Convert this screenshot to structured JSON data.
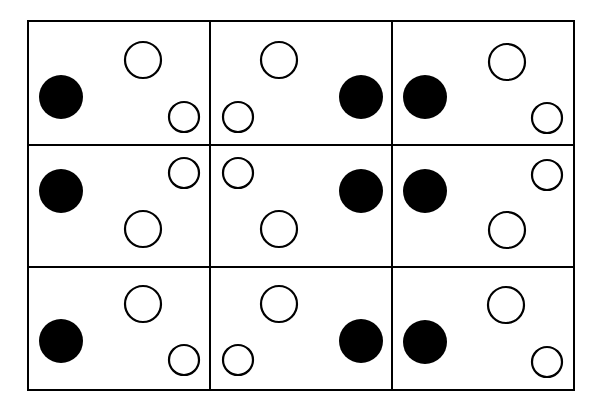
{
  "diagram": {
    "colors": {
      "stroke": "#000000",
      "filled": "#000000",
      "background": "#ffffff"
    },
    "grid": {
      "left": 28,
      "top": 21,
      "right": 574,
      "bottom": 390,
      "cols": [
        28,
        210,
        392,
        574
      ],
      "rows": [
        21,
        145,
        267,
        390
      ]
    },
    "cells": [
      {
        "row": 1,
        "col": 1,
        "circles": [
          {
            "cx": 61,
            "cy": 97,
            "r": 22,
            "filled": true
          },
          {
            "cx": 143,
            "cy": 60,
            "r": 18,
            "filled": false
          },
          {
            "cx": 184,
            "cy": 117,
            "r": 15,
            "filled": false
          }
        ]
      },
      {
        "row": 1,
        "col": 2,
        "circles": [
          {
            "cx": 279,
            "cy": 60,
            "r": 18,
            "filled": false
          },
          {
            "cx": 238,
            "cy": 117,
            "r": 15,
            "filled": false
          },
          {
            "cx": 361,
            "cy": 97,
            "r": 22,
            "filled": true
          }
        ]
      },
      {
        "row": 1,
        "col": 3,
        "circles": [
          {
            "cx": 425,
            "cy": 97,
            "r": 22,
            "filled": true
          },
          {
            "cx": 507,
            "cy": 62,
            "r": 18,
            "filled": false
          },
          {
            "cx": 547,
            "cy": 118,
            "r": 15,
            "filled": false
          }
        ]
      },
      {
        "row": 2,
        "col": 1,
        "circles": [
          {
            "cx": 61,
            "cy": 191,
            "r": 22,
            "filled": true
          },
          {
            "cx": 184,
            "cy": 173,
            "r": 15,
            "filled": false
          },
          {
            "cx": 143,
            "cy": 229,
            "r": 18,
            "filled": false
          }
        ]
      },
      {
        "row": 2,
        "col": 2,
        "circles": [
          {
            "cx": 238,
            "cy": 173,
            "r": 15,
            "filled": false
          },
          {
            "cx": 279,
            "cy": 229,
            "r": 18,
            "filled": false
          },
          {
            "cx": 361,
            "cy": 191,
            "r": 22,
            "filled": true
          }
        ]
      },
      {
        "row": 2,
        "col": 3,
        "circles": [
          {
            "cx": 425,
            "cy": 191,
            "r": 22,
            "filled": true
          },
          {
            "cx": 547,
            "cy": 175,
            "r": 15,
            "filled": false
          },
          {
            "cx": 507,
            "cy": 230,
            "r": 18,
            "filled": false
          }
        ]
      },
      {
        "row": 3,
        "col": 1,
        "circles": [
          {
            "cx": 61,
            "cy": 341,
            "r": 22,
            "filled": true
          },
          {
            "cx": 143,
            "cy": 304,
            "r": 18,
            "filled": false
          },
          {
            "cx": 184,
            "cy": 360,
            "r": 15,
            "filled": false
          }
        ]
      },
      {
        "row": 3,
        "col": 2,
        "circles": [
          {
            "cx": 279,
            "cy": 304,
            "r": 18,
            "filled": false
          },
          {
            "cx": 238,
            "cy": 360,
            "r": 15,
            "filled": false
          },
          {
            "cx": 361,
            "cy": 341,
            "r": 22,
            "filled": true
          }
        ]
      },
      {
        "row": 3,
        "col": 3,
        "circles": [
          {
            "cx": 425,
            "cy": 342,
            "r": 22,
            "filled": true
          },
          {
            "cx": 506,
            "cy": 305,
            "r": 18,
            "filled": false
          },
          {
            "cx": 547,
            "cy": 362,
            "r": 15,
            "filled": false
          }
        ]
      }
    ]
  }
}
